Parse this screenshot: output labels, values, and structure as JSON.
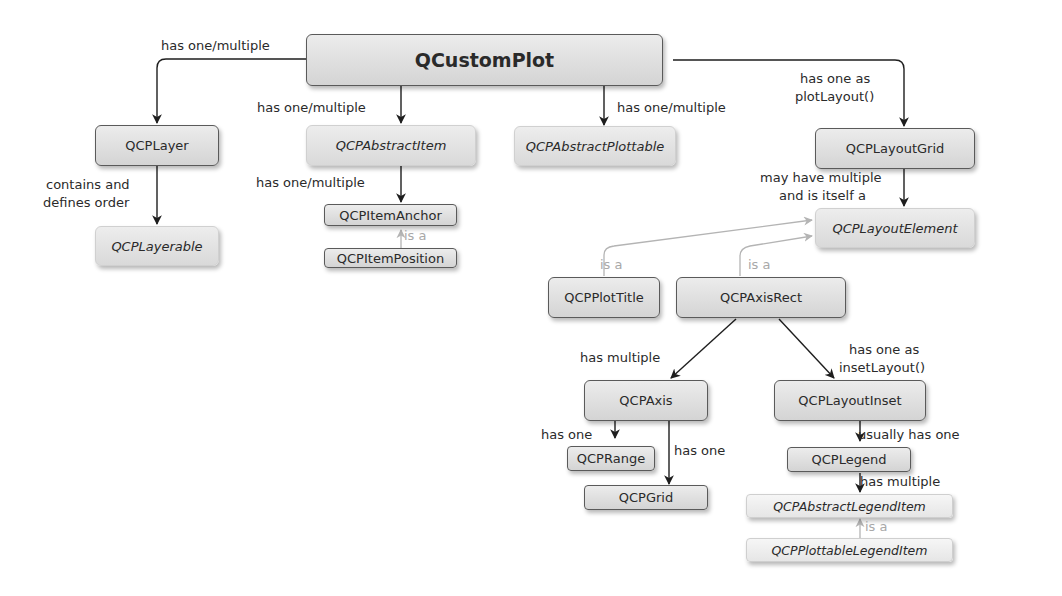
{
  "diagram": {
    "nodes": {
      "qcustomplot": "QCustomPlot",
      "qcplayer": "QCPLayer",
      "qcplayerable": "QCPLayerable",
      "qcpabstractitem": "QCPAbstractItem",
      "qcpitemanchor": "QCPItemAnchor",
      "qcpitemposition": "QCPItemPosition",
      "qcpabstractplottable": "QCPAbstractPlottable",
      "qcplayoutgrid": "QCPLayoutGrid",
      "qcplayoutelement": "QCPLayoutElement",
      "qcpplottitle": "QCPPlotTitle",
      "qcpaxisrect": "QCPAxisRect",
      "qcpaxis": "QCPAxis",
      "qcprange": "QCPRange",
      "qcpgrid": "QCPGrid",
      "qcplayoutinset": "QCPLayoutInset",
      "qcplegend": "QCPLegend",
      "qcpabstractlegenditem": "QCPAbstractLegendItem",
      "qcpplottablelegenditem": "QCPPlottableLegendItem"
    },
    "edges": [
      {
        "from": "QCustomPlot",
        "to": "QCPLayer",
        "label": "has one/multiple",
        "type": "composition"
      },
      {
        "from": "QCustomPlot",
        "to": "QCPAbstractItem",
        "label": "has one/multiple",
        "type": "composition"
      },
      {
        "from": "QCustomPlot",
        "to": "QCPAbstractPlottable",
        "label": "has one/multiple",
        "type": "composition"
      },
      {
        "from": "QCustomPlot",
        "to": "QCPLayoutGrid",
        "label": "has one as plotLayout()",
        "type": "composition"
      },
      {
        "from": "QCPLayer",
        "to": "QCPLayerable",
        "label": "contains and defines order",
        "type": "composition"
      },
      {
        "from": "QCPAbstractItem",
        "to": "QCPItemAnchor",
        "label": "has one/multiple",
        "type": "composition"
      },
      {
        "from": "QCPItemPosition",
        "to": "QCPItemAnchor",
        "label": "is a",
        "type": "inheritance"
      },
      {
        "from": "QCPLayoutGrid",
        "to": "QCPLayoutElement",
        "label": "may have multiple and is itself a",
        "type": "composition"
      },
      {
        "from": "QCPPlotTitle",
        "to": "QCPLayoutElement",
        "label": "is a",
        "type": "inheritance"
      },
      {
        "from": "QCPAxisRect",
        "to": "QCPLayoutElement",
        "label": "is a",
        "type": "inheritance"
      },
      {
        "from": "QCPAxisRect",
        "to": "QCPAxis",
        "label": "has multiple",
        "type": "composition"
      },
      {
        "from": "QCPAxisRect",
        "to": "QCPLayoutInset",
        "label": "has one as insetLayout()",
        "type": "composition"
      },
      {
        "from": "QCPAxis",
        "to": "QCPRange",
        "label": "has one",
        "type": "composition"
      },
      {
        "from": "QCPAxis",
        "to": "QCPGrid",
        "label": "has one",
        "type": "composition"
      },
      {
        "from": "QCPLayoutInset",
        "to": "QCPLegend",
        "label": "usually has one",
        "type": "composition"
      },
      {
        "from": "QCPLegend",
        "to": "QCPAbstractLegendItem",
        "label": "has multiple",
        "type": "composition"
      },
      {
        "from": "QCPPlottableLegendItem",
        "to": "QCPAbstractLegendItem",
        "label": "is a",
        "type": "inheritance"
      }
    ],
    "labels": {
      "root_layer": "has one/multiple",
      "root_item": "has one/multiple",
      "root_plottable": "has one/multiple",
      "root_grid_1": "has one as",
      "root_grid_2": "plotLayout()",
      "layer_layerable_1": "contains and",
      "layer_layerable_2": "defines order",
      "item_anchor": "has one/multiple",
      "position_isa": "is a",
      "grid_element_1": "may have multiple",
      "grid_element_2": "and is itself a",
      "title_isa": "is a",
      "axisrect_isa": "is a",
      "axisrect_axis": "has multiple",
      "axisrect_inset_1": "has one as",
      "axisrect_inset_2": "insetLayout()",
      "axis_range": "has one",
      "axis_grid": "has one",
      "inset_legend": "usually has one",
      "legend_items": "has multiple",
      "legenditem_isa": "is a"
    },
    "colors": {
      "edge": "#1e1e1e",
      "inheritance_edge": "#b4b4b4",
      "node_border": "#5a5a5a",
      "node_fill_top": "#ececec",
      "node_fill_bottom": "#d4d4d4"
    }
  }
}
